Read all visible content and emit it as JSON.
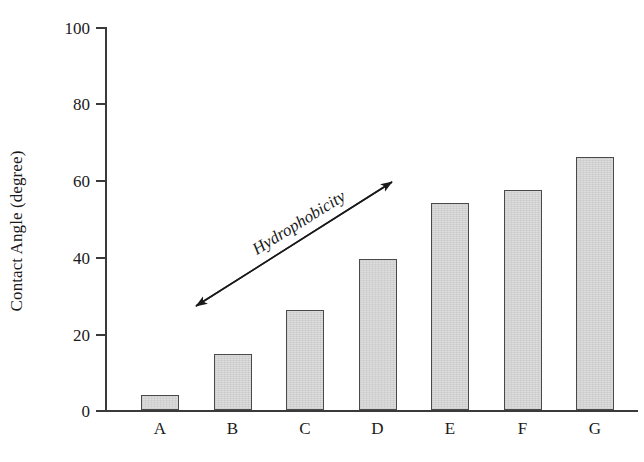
{
  "chart_data": {
    "type": "bar",
    "title": "",
    "xlabel": "",
    "ylabel": "Contact Angle (degree)",
    "categories": [
      "A",
      "B",
      "C",
      "D",
      "E",
      "F",
      "G"
    ],
    "values": [
      4,
      14.5,
      26,
      39.5,
      54,
      57.5,
      66
    ],
    "ylim": [
      0,
      100
    ],
    "yticks": [
      0,
      20,
      40,
      60,
      80,
      100
    ],
    "ytick_labels": [
      "0",
      "20",
      "40",
      "60",
      "80",
      "100"
    ],
    "grid": false,
    "legend": "none",
    "annotations": [
      {
        "text": "Hydrophobicity",
        "type": "double-headed-arrow",
        "direction": "up-right"
      }
    ],
    "colors": {
      "bar_fill": "#dcdcdc",
      "bar_border": "#4a4a4a",
      "axis": "#3a3a3a",
      "text": "#1a1a1a",
      "background": "#ffffff"
    }
  },
  "axis": {
    "y_title": "Contact Angle (degree)"
  },
  "annotation": {
    "label": "Hydrophobicity"
  }
}
